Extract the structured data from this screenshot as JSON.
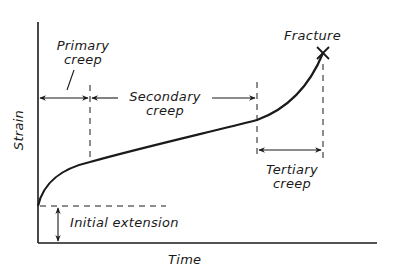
{
  "diagram": {
    "axes": {
      "x_label": "Time",
      "y_label": "Strain"
    },
    "stages": {
      "primary": {
        "line1": "Primary",
        "line2": "creep"
      },
      "secondary": {
        "line1": "Secondary",
        "line2": "creep"
      },
      "tertiary": {
        "line1": "Tertiary",
        "line2": "creep"
      }
    },
    "annotations": {
      "fracture": "Fracture",
      "initial_extension": "Initial extension"
    },
    "colors": {
      "ink": "#1a1a1a",
      "background": "#ffffff"
    }
  }
}
